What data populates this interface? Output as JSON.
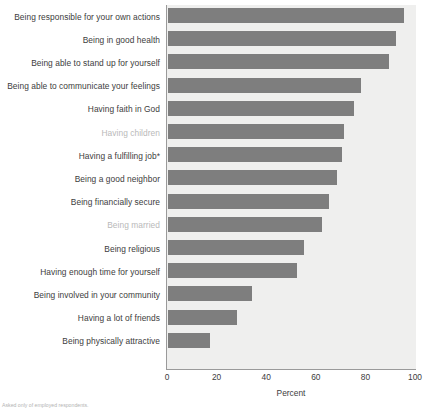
{
  "chart_data": {
    "type": "bar",
    "orientation": "horizontal",
    "title": "",
    "xlabel": "Percent",
    "ylabel": "",
    "xlim": [
      0,
      100
    ],
    "xticks": [
      0,
      20,
      40,
      60,
      80,
      100
    ],
    "grid": false,
    "legend": null,
    "bar_color": "#7e7e7e",
    "plot_background": "#efefee",
    "categories": [
      "Being responsible for your own actions",
      "Being in good health",
      "Being able to stand up for yourself",
      "Being able to communicate your feelings",
      "Having faith in God",
      "Having children",
      "Having a fulfilling job*",
      "Being a good neighbor",
      "Being financially secure",
      "Being married",
      "Being religious",
      "Having enough time for yourself",
      "Being involved in your community",
      "Having a lot of friends",
      "Being physically attractive"
    ],
    "values": [
      95,
      92,
      89,
      78,
      75,
      71,
      70,
      68,
      65,
      62,
      55,
      52,
      34,
      28,
      17
    ],
    "highlighted_categories": [
      "Having children",
      "Being married"
    ],
    "annotations": [
      "Asked only of employed respondents."
    ]
  },
  "footnote": "Asked only of employed respondents."
}
